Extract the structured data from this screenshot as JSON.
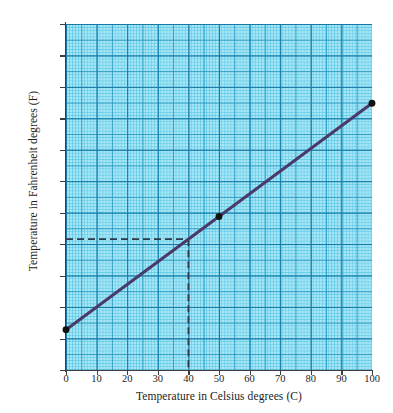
{
  "chart_data": {
    "type": "line",
    "title": "",
    "xlabel": "Temperature in Celsius degrees (C)",
    "ylabel": "Temperature in Fahrenheit degrees (F)",
    "xlim": [
      0,
      100
    ],
    "ylim": [
      0,
      275
    ],
    "xticks": [
      0,
      10,
      20,
      30,
      40,
      50,
      60,
      70,
      80,
      90,
      100
    ],
    "yticks": [
      0,
      25,
      50,
      75,
      100,
      125,
      150,
      175,
      200,
      225,
      250,
      275
    ],
    "xtick_labels": [
      "0",
      "10",
      "20",
      "30",
      "40",
      "50",
      "60",
      "70",
      "80",
      "90",
      "100"
    ],
    "ytick_labels": [
      "0",
      "25",
      "50",
      "75",
      "100",
      "125",
      "150",
      "175",
      "200",
      "225",
      "250",
      "275"
    ],
    "grid": true,
    "grid_style": "graph-paper",
    "legend": false,
    "series": [
      {
        "name": "Celsius to Fahrenheit conversion",
        "x": [
          0,
          100
        ],
        "values": [
          32,
          212
        ],
        "color": "#4a3a6b",
        "line_width": 3,
        "relation": "F = 1.8C + 32"
      }
    ],
    "markers": [
      {
        "label": "freezing-point",
        "x": 0,
        "y": 32,
        "color": "#111111"
      },
      {
        "label": "midpoint-reading",
        "x": 50,
        "y": 122,
        "color": "#111111"
      },
      {
        "label": "boiling-point",
        "x": 100,
        "y": 212,
        "color": "#111111"
      }
    ],
    "annotations": [
      {
        "type": "dashed-guide",
        "label": "reading-guide-40C",
        "x": 40,
        "y": 104,
        "color": "#2b3a4f",
        "description": "Dashed horizontal guide from F axis at 104 to the line, then vertical guide down to C axis at 40"
      }
    ],
    "plot_background": "#a8e6f5",
    "grid_minor_color": "#5ac8e6",
    "grid_major_color": "#1478a5",
    "axis_color": "#3d3d3d",
    "page_background": "#ffffff"
  }
}
